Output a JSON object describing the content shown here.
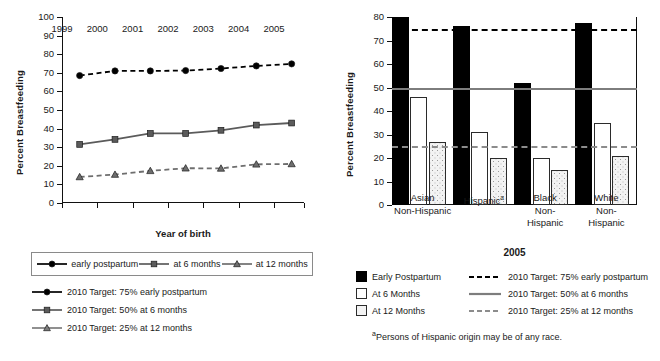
{
  "chart_data": [
    {
      "type": "line",
      "id": "trends-by-year-of-birth",
      "title": "",
      "xlabel": "Year of birth",
      "ylabel": "Percent Breastfeeding",
      "xlim": [
        1999,
        2005.85
      ],
      "ylim": [
        0,
        100
      ],
      "ytick_labels": [
        "0",
        "10",
        "20",
        "30",
        "40",
        "50",
        "60",
        "70",
        "80",
        "90",
        "100"
      ],
      "ytick_values": [
        0,
        10,
        20,
        30,
        40,
        50,
        60,
        70,
        80,
        90,
        100
      ],
      "xtick_labels": [
        "1999",
        "2000",
        "2001",
        "2002",
        "2003",
        "2004",
        "2005"
      ],
      "xtick_values": [
        1999,
        2000,
        2001,
        2002,
        2003,
        2004,
        2005
      ],
      "x": [
        1999.5,
        2000.5,
        2001.5,
        2002.5,
        2003.5,
        2004.5,
        2005.5
      ],
      "grid": false,
      "legend_position": "below",
      "series": [
        {
          "name": "early postpartum",
          "marker": "circle",
          "linestyle": "dashed",
          "color": "#000000",
          "values": [
            68.5,
            71.0,
            71.0,
            71.2,
            72.3,
            73.7,
            74.8
          ]
        },
        {
          "name": "at 6 months",
          "marker": "square",
          "linestyle": "solid",
          "color": "#5b5b5b",
          "values": [
            31.5,
            34.2,
            37.4,
            37.4,
            39.1,
            41.9,
            43.0
          ]
        },
        {
          "name": "at 12 months",
          "marker": "triangle",
          "linestyle": "dashed",
          "color": "#6e6e6e",
          "values": [
            14.0,
            15.3,
            17.3,
            18.7,
            18.6,
            20.8,
            21.0
          ]
        }
      ],
      "legend_entries": [
        "early postpartum",
        "at 6 months",
        "at 12 months"
      ],
      "target_legend": [
        {
          "label": "2010 Target: 75% early postpartum",
          "marker": "circle",
          "linestyle": "solid",
          "color": "#000000"
        },
        {
          "label": "2010 Target: 50% at 6 months",
          "marker": "square",
          "linestyle": "solid",
          "color": "#5b5b5b"
        },
        {
          "label": "2010 Target: 25% at 12 months",
          "marker": "triangle",
          "linestyle": "solid",
          "color": "#7d7d7d"
        }
      ]
    },
    {
      "type": "bar",
      "id": "breastfeeding-by-race-2005",
      "title": "2005",
      "xlabel": "",
      "ylabel": "Percent Breastfeeding",
      "ylim": [
        0,
        80
      ],
      "ytick_labels": [
        "0",
        "10",
        "20",
        "30",
        "40",
        "50",
        "60",
        "70",
        "80"
      ],
      "ytick_values": [
        0,
        10,
        20,
        30,
        40,
        50,
        60,
        70,
        80
      ],
      "categories": [
        {
          "line1": "Asian",
          "line2": "Non-Hispanic",
          "line3": ""
        },
        {
          "line1": "Hispanic",
          "line2": "",
          "line3": "",
          "superscript": "a"
        },
        {
          "line1": "Black",
          "line2": "Non-",
          "line3": "Hispanic"
        },
        {
          "line1": "White",
          "line2": "Non-",
          "line3": "Hispanic"
        }
      ],
      "grid": false,
      "legend_position": "below",
      "series": [
        {
          "name": "Early Postpartum",
          "fill": "black",
          "values": [
            80,
            76,
            52,
            77.5
          ]
        },
        {
          "name": "At 6 Months",
          "fill": "white",
          "values": [
            46,
            31,
            20,
            35
          ]
        },
        {
          "name": "At 12 Months",
          "fill": "dotted",
          "values": [
            27,
            20,
            15,
            21
          ]
        }
      ],
      "target_lines": [
        {
          "label": "2010 Target: 75% early postpartum",
          "value": 75,
          "style": "dashed",
          "color": "#000000"
        },
        {
          "label": "2010 Target: 50% at 6 months",
          "value": 50,
          "style": "solid",
          "color": "#7d7d7d"
        },
        {
          "label": "2010 Target: 25% at 12 months",
          "value": 25,
          "style": "dashed",
          "color": "#8c8c8c"
        }
      ],
      "footnote": "Persons of Hispanic origin may be of any race.",
      "footnote_marker": "a"
    }
  ],
  "left": {
    "ylabel": "Percent Breastfeeding",
    "xlabel": "Year of birth",
    "legend": [
      "early postpartum",
      "at 6 months",
      "at 12 months"
    ],
    "targets": [
      "2010 Target: 75% early postpartum",
      "2010 Target: 50% at 6 months",
      "2010 Target: 25% at 12 months"
    ]
  },
  "right": {
    "ylabel": "Percent Breastfeeding",
    "year": "2005",
    "categories": [
      "Asian Non-Hispanic",
      "Hispanic",
      "Black Non-Hispanic",
      "White Non-Hispanic"
    ],
    "legend_swatches": [
      "Early Postpartum",
      "At 6 Months",
      "At 12 Months"
    ],
    "legend_targets": [
      "2010 Target: 75% early postpartum",
      "2010 Target: 50% at 6 months",
      "2010 Target: 25% at 12 months"
    ],
    "footnote_marker": "a",
    "footnote": "Persons of Hispanic origin may be of any race."
  },
  "colors": {
    "ink": "#000000",
    "gray_series": "#5b5b5b",
    "gray_target": "#7d7d7d",
    "dotted_fill": "#f3f3f3"
  }
}
